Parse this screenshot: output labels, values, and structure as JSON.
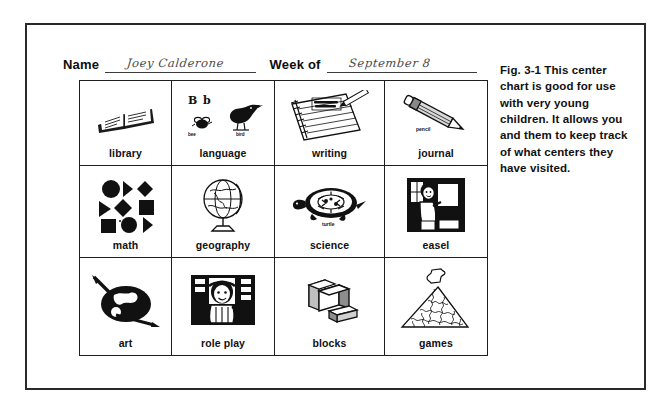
{
  "form": {
    "name_label": "Name",
    "name_value": "Joey Calderone",
    "week_label": "Week of",
    "week_value": "September 8"
  },
  "caption": {
    "text": "Fig. 3-1  This center chart is good for use with very young children. It allows you and them to keep track of what centers they have visited."
  },
  "chart": {
    "columns": 4,
    "rows": 3,
    "cells": [
      {
        "label": "library",
        "icon": "open-book-icon"
      },
      {
        "label": "language",
        "icon": "letters-bee-bird-icon",
        "sub_letters": "B  b",
        "sub_bee": "bee",
        "sub_bird": "bird"
      },
      {
        "label": "writing",
        "icon": "notepad-pencil-icon"
      },
      {
        "label": "journal",
        "icon": "pencil-icon",
        "sub_pencil": "pencil"
      },
      {
        "label": "math",
        "icon": "shapes-icon"
      },
      {
        "label": "geography",
        "icon": "globe-icon"
      },
      {
        "label": "science",
        "icon": "turtle-icon",
        "sub_turtle": "turtle"
      },
      {
        "label": "easel",
        "icon": "child-at-easel-icon"
      },
      {
        "label": "art",
        "icon": "paint-palette-icon"
      },
      {
        "label": "role play",
        "icon": "child-dress-up-icon"
      },
      {
        "label": "blocks",
        "icon": "blocks-icon"
      },
      {
        "label": "games",
        "icon": "jigsaw-puzzle-icon"
      }
    ]
  },
  "colors": {
    "ink": "#111111",
    "frame": "#2a2a2a",
    "rule": "#3a3a3a",
    "handwriting": "#4a4a4a",
    "paper": "#ffffff"
  }
}
